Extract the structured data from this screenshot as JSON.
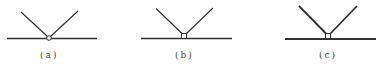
{
  "figures": [
    {
      "label": "(a)",
      "joint": "circle",
      "label_x": 40,
      "label_y": 50
    },
    {
      "label": "(b)",
      "joint": "square",
      "label_x": 175,
      "label_y": 50
    },
    {
      "label": "(c)",
      "joint": "square",
      "label_x": 319,
      "label_y": 50
    }
  ],
  "colors": {
    "stroke": "#333333",
    "text": "#444444",
    "background": "#ffffff"
  }
}
